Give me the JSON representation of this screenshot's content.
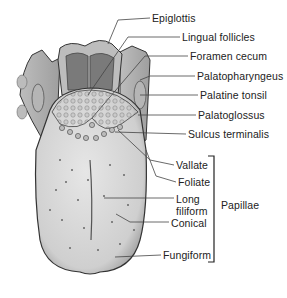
{
  "diagram": {
    "labels": [
      {
        "id": "epiglottis",
        "text": "Epiglottis",
        "x": 152,
        "y": 13
      },
      {
        "id": "lingual-follicles",
        "text": "Lingual follicles",
        "x": 182,
        "y": 32
      },
      {
        "id": "foramen-cecum",
        "text": "Foramen cecum",
        "x": 190,
        "y": 51
      },
      {
        "id": "palatopharyngeus",
        "text": "Palatopharyngeus",
        "x": 197,
        "y": 71
      },
      {
        "id": "palatine-tonsil",
        "text": "Palatine tonsil",
        "x": 200,
        "y": 90
      },
      {
        "id": "palatoglossus",
        "text": "Palatoglossus",
        "x": 198,
        "y": 110
      },
      {
        "id": "sulcus-terminalis",
        "text": "Sulcus terminalis",
        "x": 188,
        "y": 129
      },
      {
        "id": "vallate",
        "text": "Vallate",
        "x": 176,
        "y": 160
      },
      {
        "id": "foliate",
        "text": "Foliate",
        "x": 178,
        "y": 177
      },
      {
        "id": "long-filiform-1",
        "text": "Long",
        "x": 176,
        "y": 194
      },
      {
        "id": "long-filiform-2",
        "text": "filiform",
        "x": 176,
        "y": 206
      },
      {
        "id": "conical",
        "text": "Conical",
        "x": 171,
        "y": 218
      },
      {
        "id": "fungiform",
        "text": "Fungiform",
        "x": 163,
        "y": 250
      }
    ],
    "group_label": {
      "text": "Papillae",
      "x": 221,
      "y": 200
    },
    "colors": {
      "outline": "#333333",
      "tongue": "#d4d4d4",
      "dark": "#7a7a7a",
      "mid": "#a8a8a8",
      "leader": "#444444"
    }
  }
}
